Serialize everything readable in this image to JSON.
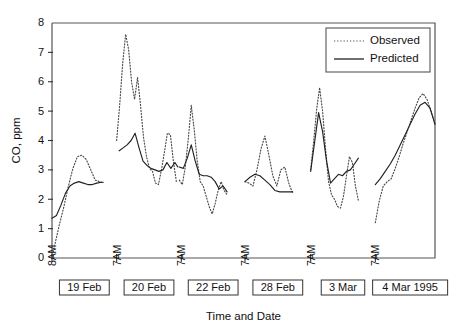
{
  "chart_data": {
    "type": "line",
    "title": "",
    "xlabel": "Time and Date",
    "ylabel": "CO, ppm",
    "ylim": [
      0,
      8
    ],
    "yticks": [
      0,
      1,
      2,
      3,
      4,
      5,
      6,
      7,
      8
    ],
    "ytick_labels": [
      "0",
      "1",
      "2",
      "3",
      "4",
      "5",
      "6",
      "7",
      "8"
    ],
    "grid": false,
    "legend_position": "top-right",
    "legend": [
      "Observed",
      "Predicted"
    ],
    "xtick_labels": [
      "8AM",
      "7AM",
      "7AM",
      "7AM",
      "7AM",
      "7AM"
    ],
    "xtick_positions": [
      0,
      13,
      26,
      38.8,
      52,
      65
    ],
    "date_boxes": [
      {
        "label": "19 Feb",
        "center": 6.5
      },
      {
        "label": "20 Feb",
        "center": 19.5
      },
      {
        "label": "22 Feb",
        "center": 32.4
      },
      {
        "label": "28 Feb",
        "center": 45.4
      },
      {
        "label": "3 Mar",
        "center": 58.5
      },
      {
        "label": "4 Mar 1995",
        "center": 72.0
      }
    ],
    "xlim": [
      0,
      77
    ],
    "series": [
      {
        "name": "Observed",
        "style": "dotted",
        "segments": [
          {
            "x": [
              0.0,
              0.7,
              1.5,
              2.4,
              3.3,
              4.2,
              5.1,
              6.0,
              6.9,
              7.8,
              8.7,
              9.6,
              10.3
            ],
            "y": [
              0.0,
              0.55,
              1.15,
              1.75,
              2.45,
              3.05,
              3.45,
              3.5,
              3.35,
              3.0,
              2.65,
              2.6,
              2.55
            ]
          },
          {
            "x": [
              13.0,
              13.6,
              14.2,
              14.8,
              15.4,
              16.0,
              16.6,
              17.2,
              17.8,
              18.4,
              19.0,
              19.6,
              20.2,
              20.8,
              21.4,
              22.0,
              22.6,
              23.2,
              23.8,
              24.4,
              25.0
            ],
            "y": [
              4.0,
              5.2,
              6.6,
              7.62,
              7.1,
              6.0,
              5.4,
              6.15,
              5.2,
              4.1,
              3.45,
              3.05,
              2.95,
              2.55,
              2.5,
              3.0,
              3.6,
              4.25,
              4.2,
              3.3,
              2.6
            ]
          },
          {
            "x": [
              25.6,
              26.2,
              26.8,
              27.4,
              28.0,
              28.6,
              29.2,
              29.8,
              30.4,
              31.0,
              31.6,
              32.2,
              32.8,
              33.4,
              34.0,
              34.6,
              35.2
            ],
            "y": [
              2.65,
              2.5,
              3.1,
              4.05,
              5.2,
              4.35,
              3.3,
              2.6,
              2.45,
              2.1,
              1.75,
              1.5,
              1.85,
              2.3,
              2.6,
              2.3,
              2.15
            ]
          },
          {
            "x": [
              38.8,
              39.6,
              40.4,
              41.2,
              42.0,
              42.8,
              43.6,
              44.4,
              45.2,
              46.0,
              46.8,
              47.6,
              48.4
            ],
            "y": [
              2.6,
              2.55,
              2.45,
              3.0,
              3.7,
              4.15,
              3.5,
              2.8,
              2.45,
              3.0,
              3.1,
              2.55,
              2.2
            ]
          },
          {
            "x": [
              52.0,
              52.6,
              53.2,
              53.8,
              54.4,
              55.0,
              55.6,
              56.2,
              56.8,
              57.4,
              58.0,
              58.6,
              59.2,
              59.8,
              60.4,
              61.0,
              61.6
            ],
            "y": [
              3.0,
              3.95,
              5.05,
              5.8,
              5.0,
              3.7,
              2.6,
              2.15,
              2.0,
              1.75,
              1.7,
              2.1,
              2.8,
              3.45,
              3.25,
              2.45,
              1.95
            ]
          },
          {
            "x": [
              65.0,
              65.8,
              66.6,
              67.4,
              68.2,
              69.0,
              69.8,
              70.6,
              71.4,
              72.2,
              73.0,
              73.8,
              74.6,
              75.4,
              76.2,
              77.0
            ],
            "y": [
              1.2,
              1.95,
              2.45,
              2.6,
              2.7,
              3.05,
              3.45,
              3.9,
              4.3,
              4.7,
              5.1,
              5.45,
              5.6,
              5.4,
              5.0,
              4.55
            ]
          }
        ]
      },
      {
        "name": "Predicted",
        "style": "solid",
        "segments": [
          {
            "x": [
              0.0,
              0.9,
              1.8,
              2.7,
              3.6,
              4.5,
              5.4,
              6.3,
              7.2,
              8.1,
              9.0,
              9.9,
              10.3
            ],
            "y": [
              1.35,
              1.45,
              1.8,
              2.2,
              2.45,
              2.55,
              2.6,
              2.55,
              2.5,
              2.5,
              2.55,
              2.58,
              2.58
            ]
          },
          {
            "x": [
              13.5,
              14.3,
              15.1,
              15.9,
              16.7,
              17.5,
              18.3,
              19.1,
              19.9,
              20.7,
              21.5,
              22.3,
              23.1,
              23.9,
              24.7,
              25.3
            ],
            "y": [
              3.65,
              3.75,
              3.85,
              4.0,
              4.25,
              3.75,
              3.3,
              3.15,
              3.05,
              3.0,
              2.95,
              3.0,
              3.25,
              3.05,
              3.25,
              3.1
            ]
          },
          {
            "x": [
              25.6,
              26.4,
              27.2,
              28.0,
              28.8,
              29.6,
              30.4,
              31.2,
              32.0,
              32.8,
              33.6,
              34.4,
              35.2
            ],
            "y": [
              3.1,
              3.05,
              3.4,
              3.85,
              3.3,
              2.85,
              2.8,
              2.8,
              2.75,
              2.6,
              2.35,
              2.45,
              2.25
            ]
          },
          {
            "x": [
              38.8,
              39.8,
              40.8,
              41.8,
              42.8,
              43.8,
              44.8,
              45.8,
              46.8,
              47.8,
              48.4
            ],
            "y": [
              2.6,
              2.75,
              2.85,
              2.8,
              2.65,
              2.5,
              2.3,
              2.25,
              2.25,
              2.25,
              2.25
            ]
          },
          {
            "x": [
              52.0,
              52.8,
              53.6,
              54.4,
              55.2,
              56.0,
              56.8,
              57.6,
              58.4,
              59.2,
              60.0,
              60.8,
              61.6
            ],
            "y": [
              2.95,
              3.95,
              4.95,
              4.3,
              3.3,
              2.55,
              2.7,
              2.85,
              2.8,
              2.95,
              3.0,
              3.2,
              3.4
            ]
          },
          {
            "x": [
              65.0,
              66.0,
              67.0,
              68.0,
              69.0,
              70.0,
              71.0,
              72.0,
              73.0,
              74.0,
              75.0,
              76.0,
              77.0
            ],
            "y": [
              2.5,
              2.7,
              2.95,
              3.2,
              3.5,
              3.85,
              4.2,
              4.55,
              4.9,
              5.2,
              5.3,
              5.1,
              4.55
            ]
          }
        ]
      }
    ]
  },
  "axes": {
    "y_title": "CO, ppm",
    "x_title": "Time and Date"
  },
  "legend": {
    "observed_label": "Observed",
    "predicted_label": "Predicted"
  }
}
